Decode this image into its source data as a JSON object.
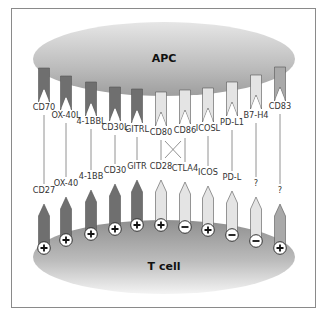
{
  "diagram": {
    "apc_label": "APC",
    "tcell_label": "T cell",
    "colors": {
      "dark": "#6f6f6f",
      "light": "#e4e4e4",
      "medium": "#a9a9a9",
      "outline": "#555555",
      "line": "#777777"
    },
    "pairs": [
      {
        "ligand": "CD70",
        "receptor": "CD27",
        "signal": "+",
        "shade": "dark"
      },
      {
        "ligand": "OX-40L",
        "receptor": "OX-40",
        "signal": "+",
        "shade": "dark"
      },
      {
        "ligand": "4-1BBL",
        "receptor": "4-1BB",
        "signal": "+",
        "shade": "dark"
      },
      {
        "ligand": "CD30L",
        "receptor": "CD30",
        "signal": "+",
        "shade": "dark"
      },
      {
        "ligand": "GITRL",
        "receptor": "GITR",
        "signal": "+",
        "shade": "dark"
      },
      {
        "ligand": "CD80",
        "receptor": "CD28",
        "signal": "+",
        "shade": "light"
      },
      {
        "ligand": "CD86",
        "receptor": "CTLA4",
        "signal": "−",
        "shade": "light"
      },
      {
        "ligand": "ICOSL",
        "receptor": "ICOS",
        "signal": "+",
        "shade": "light"
      },
      {
        "ligand": "PD-L1",
        "receptor": "PD-L",
        "signal": "−",
        "shade": "light"
      },
      {
        "ligand": "B7-H4",
        "receptor": "?",
        "signal": "−",
        "shade": "light"
      },
      {
        "ligand": "CD83",
        "receptor": "?",
        "signal": "+",
        "shade": "medium"
      }
    ]
  }
}
